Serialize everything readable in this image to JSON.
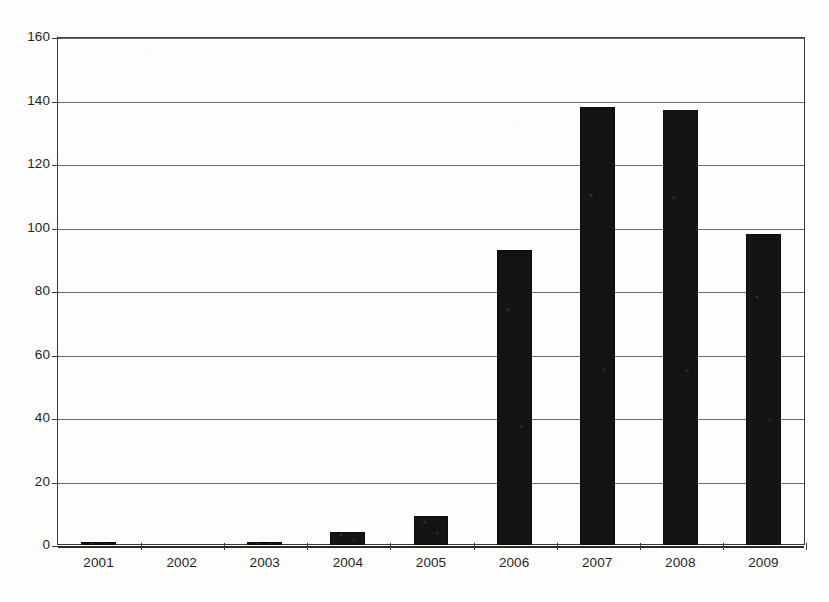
{
  "chart_data": {
    "type": "bar",
    "title": "",
    "subtitle": "",
    "xlabel": "",
    "ylabel": "",
    "categories": [
      "2001",
      "2002",
      "2003",
      "2004",
      "2005",
      "2006",
      "2007",
      "2008",
      "2009"
    ],
    "values": [
      1,
      0,
      1,
      4,
      9,
      93,
      138,
      137,
      98
    ],
    "ylim": [
      0,
      160
    ],
    "yticks": [
      0,
      20,
      40,
      60,
      80,
      100,
      120,
      140,
      160
    ],
    "ytick_labels": [
      "0",
      "20",
      "40",
      "60",
      "80",
      "100",
      "120",
      "140",
      "160"
    ],
    "grid": true,
    "grid_axis": "y",
    "legend": null,
    "legend_position": "none",
    "annotations": [],
    "series": [
      {
        "name": "count",
        "values": [
          1,
          0,
          1,
          4,
          9,
          93,
          138,
          137,
          98
        ],
        "color": "#141414"
      }
    ],
    "bar_color": "#141414",
    "frame_color": "#3a3a3a",
    "gridline_color": "#6a6a6a",
    "background_color": "#ffffff"
  },
  "figure": {
    "name": "bar-chart"
  }
}
